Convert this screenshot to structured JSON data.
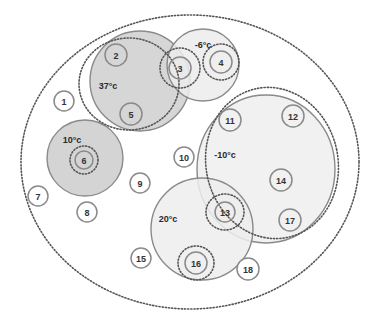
{
  "diagram": {
    "type": "venn-cluster",
    "outer_boundary": {
      "shape": "dotted-ellipse",
      "cx": 190,
      "cy": 162,
      "rx": 169,
      "ry": 147
    },
    "zones": [
      {
        "id": "zone-37",
        "label": "37°c",
        "cx": 140,
        "cy": 81,
        "r": 50,
        "fill": "#cfcfcf",
        "label_x": 108,
        "label_y": 86
      },
      {
        "id": "zone-minus6",
        "label": "-6°c",
        "cx": 203,
        "cy": 65,
        "r": 36,
        "fill": "#ececec",
        "label_x": 203,
        "label_y": 45
      },
      {
        "id": "zone-10",
        "label": "10°c",
        "cx": 85,
        "cy": 158,
        "r": 38,
        "fill": "#cdcdcd",
        "label_x": 72,
        "label_y": 140
      },
      {
        "id": "zone-minus10",
        "label": "-10°c",
        "cx": 266,
        "cy": 169,
        "rx": 69,
        "ry": 74,
        "fill": "#efefef",
        "label_x": 225,
        "label_y": 155
      },
      {
        "id": "zone-20",
        "label": "20°c",
        "cx": 202,
        "cy": 229,
        "r": 51,
        "fill": "#ededed",
        "label_x": 168,
        "label_y": 219
      }
    ],
    "dotted_groups": [
      {
        "id": "group-37",
        "cx": 129,
        "cy": 84,
        "rx": 50,
        "ry": 46,
        "rotate": 0
      },
      {
        "id": "group-minus10",
        "cx": 272,
        "cy": 163,
        "rx": 66,
        "ry": 76,
        "rotate": -12
      },
      {
        "id": "ring-3",
        "cx": 180,
        "cy": 68,
        "rx": 20,
        "ry": 20,
        "rotate": 0
      },
      {
        "id": "ring-4",
        "cx": 221,
        "cy": 62,
        "rx": 18,
        "ry": 18,
        "rotate": 0
      },
      {
        "id": "ring-6",
        "cx": 84,
        "cy": 160,
        "rx": 14,
        "ry": 14,
        "rotate": 0
      },
      {
        "id": "ring-13",
        "cx": 225,
        "cy": 212,
        "rx": 19,
        "ry": 18,
        "rotate": 0
      },
      {
        "id": "ring-16",
        "cx": 196,
        "cy": 263,
        "rx": 18,
        "ry": 17,
        "rotate": 0
      }
    ],
    "nodes": [
      {
        "id": "1",
        "label": "1",
        "cx": 64,
        "cy": 101,
        "r": 10,
        "bg": true
      },
      {
        "id": "2",
        "label": "2",
        "cx": 116,
        "cy": 55,
        "r": 11,
        "bg": false
      },
      {
        "id": "3",
        "label": "3",
        "cx": 180,
        "cy": 68,
        "r": 11,
        "bg": false
      },
      {
        "id": "4",
        "label": "4",
        "cx": 221,
        "cy": 62,
        "r": 11,
        "bg": false
      },
      {
        "id": "5",
        "label": "5",
        "cx": 131,
        "cy": 114,
        "r": 11,
        "bg": false
      },
      {
        "id": "6",
        "label": "6",
        "cx": 84,
        "cy": 160,
        "r": 9,
        "bg": false
      },
      {
        "id": "7",
        "label": "7",
        "cx": 38,
        "cy": 196,
        "r": 10,
        "bg": true
      },
      {
        "id": "8",
        "label": "8",
        "cx": 87,
        "cy": 212,
        "r": 10,
        "bg": true
      },
      {
        "id": "9",
        "label": "9",
        "cx": 140,
        "cy": 183,
        "r": 10,
        "bg": true
      },
      {
        "id": "10",
        "label": "10",
        "cx": 184,
        "cy": 157,
        "r": 10,
        "bg": true
      },
      {
        "id": "11",
        "label": "11",
        "cx": 230,
        "cy": 120,
        "r": 11,
        "bg": false
      },
      {
        "id": "12",
        "label": "12",
        "cx": 293,
        "cy": 116,
        "r": 11,
        "bg": false
      },
      {
        "id": "13",
        "label": "13",
        "cx": 225,
        "cy": 212,
        "r": 10,
        "bg": false
      },
      {
        "id": "14",
        "label": "14",
        "cx": 281,
        "cy": 180,
        "r": 11,
        "bg": false
      },
      {
        "id": "15",
        "label": "15",
        "cx": 141,
        "cy": 258,
        "r": 10,
        "bg": true
      },
      {
        "id": "16",
        "label": "16",
        "cx": 196,
        "cy": 263,
        "r": 11,
        "bg": false
      },
      {
        "id": "17",
        "label": "17",
        "cx": 290,
        "cy": 220,
        "r": 11,
        "bg": false
      },
      {
        "id": "18",
        "label": "18",
        "cx": 248,
        "cy": 269,
        "r": 11,
        "bg": true
      }
    ]
  }
}
